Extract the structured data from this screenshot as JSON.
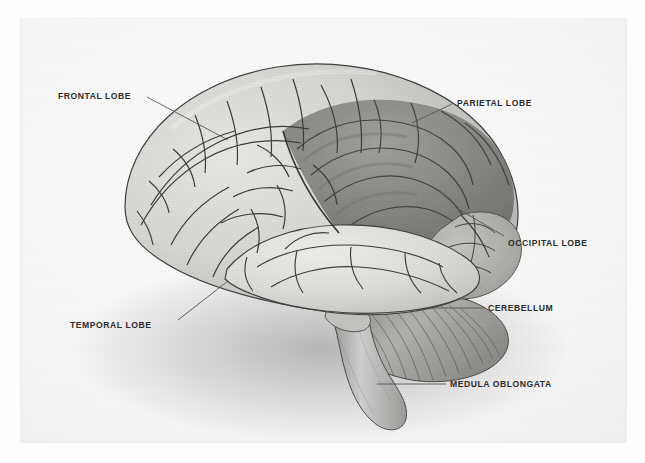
{
  "page": {
    "background_color": "#fdfdfd",
    "plate_background_color": "#f4f4f4",
    "top_edge_fragment": "",
    "illustration_title": "Human Brain — Lateral View"
  },
  "figure": {
    "style": "grayscale airbrush medical illustration",
    "orientation": "facing left",
    "label_text_color": "#2b2b2b",
    "leader_line_color": "#555555"
  },
  "labels": [
    {
      "id": "frontal-lobe",
      "text": "FRONTAL LOBE",
      "x": 58,
      "y": 91,
      "leader": {
        "x1": 147,
        "y1": 97,
        "x2": 228,
        "y2": 140
      }
    },
    {
      "id": "parietal-lobe",
      "text": "PARIETAL LOBE",
      "x": 457,
      "y": 98,
      "leader": {
        "x1": 452,
        "y1": 104,
        "x2": 412,
        "y2": 123
      }
    },
    {
      "id": "occipital-lobe",
      "text": "OCCIPITAL LOBE",
      "x": 508,
      "y": 238,
      "leader": {
        "x1": 504,
        "y1": 236,
        "x2": 455,
        "y2": 207
      }
    },
    {
      "id": "cerebellum",
      "text": "CEREBELLUM",
      "x": 488,
      "y": 303,
      "leader": {
        "x1": 484,
        "y1": 308,
        "x2": 425,
        "y2": 308
      }
    },
    {
      "id": "temporal-lobe",
      "text": "TEMPORAL LOBE",
      "x": 70,
      "y": 320,
      "leader": {
        "x1": 178,
        "y1": 320,
        "x2": 228,
        "y2": 281
      }
    },
    {
      "id": "medula-oblongata",
      "text": "MEDULA OBLONGATA",
      "x": 450,
      "y": 379,
      "leader": {
        "x1": 446,
        "y1": 384,
        "x2": 377,
        "y2": 384
      }
    }
  ],
  "regions": [
    {
      "id": "frontal-lobe",
      "name": "Frontal lobe",
      "shade": "light",
      "fill": "#d8d8d6"
    },
    {
      "id": "parietal-lobe",
      "name": "Parietal lobe",
      "shade": "dark",
      "fill": "#8f8f8d"
    },
    {
      "id": "temporal-lobe",
      "name": "Temporal lobe",
      "shade": "light",
      "fill": "#dedede"
    },
    {
      "id": "occipital-lobe",
      "name": "Occipital lobe",
      "shade": "mid",
      "fill": "#b4b4b2"
    },
    {
      "id": "cerebellum",
      "name": "Cerebellum",
      "shade": "striated",
      "fill": "#a9a9a6"
    },
    {
      "id": "medula-oblongata",
      "name": "Medula oblongata",
      "shade": "mid",
      "fill": "#bdbdba"
    }
  ]
}
